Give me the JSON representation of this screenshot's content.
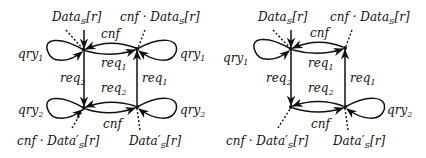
{
  "diagrams": [
    {
      "name": "left-automaton",
      "nodes": {
        "tl": {
          "x": 84,
          "y": 50
        },
        "tr": {
          "x": 137,
          "y": 49
        },
        "bl": {
          "x": 84,
          "y": 108
        },
        "br": {
          "x": 137,
          "y": 107
        }
      },
      "labels": {
        "top_left": "Data",
        "top_left_sub": "S",
        "top_left_tail": "[r]",
        "top_right_prefix": "cnf · Data",
        "top_right_sub": "S",
        "top_right_tail": "[r]",
        "bottom_left_prefix": "cnf · Data′",
        "bottom_left_sub": "S",
        "bottom_left_tail": "[r]",
        "bottom_right": "Data′",
        "bottom_right_sub": "S",
        "bottom_right_tail": "[r]",
        "cnf_top": "cnf",
        "req1_top": "req",
        "req1_top_sub": "1",
        "req2_left": "req",
        "req2_left_sub": "2",
        "req1_right": "req",
        "req1_right_sub": "1",
        "req2_bottom": "req",
        "req2_bottom_sub": "2",
        "cnf_bottom": "cnf",
        "qry1_left": "qry",
        "qry1_left_sub": "1",
        "qry1_right": "qry",
        "qry1_right_sub": "1",
        "qry2_left": "qry",
        "qry2_left_sub": "2",
        "qry2_right": "qry",
        "qry2_right_sub": "2"
      }
    },
    {
      "name": "right-automaton",
      "nodes": {
        "tl": {
          "x": 291,
          "y": 49
        },
        "tr": {
          "x": 345,
          "y": 48
        },
        "bl": {
          "x": 291,
          "y": 107
        },
        "br": {
          "x": 345,
          "y": 107
        }
      },
      "labels": {
        "top_left": "Data",
        "top_left_sub": "S",
        "top_left_tail": "[r]",
        "top_right_prefix": "cnf · Data",
        "top_right_sub": "S",
        "top_right_tail": "[r]",
        "bottom_left_prefix": "cnf · Data′",
        "bottom_left_sub": "S",
        "bottom_left_tail": "[r]",
        "bottom_right": "Data′",
        "bottom_right_sub": "S",
        "bottom_right_tail": "[r]",
        "cnf_top": "cnf",
        "req1_top": "req",
        "req1_top_sub": "1",
        "req2_left": "req",
        "req2_left_sub": "2",
        "req1_right": "req",
        "req1_right_sub": "1",
        "req2_bottom": "req",
        "req2_bottom_sub": "2",
        "cnf_bottom": "cnf",
        "qry1_left": "qry",
        "qry1_left_sub": "1",
        "qry2_right": "qry",
        "qry2_right_sub": "2"
      }
    }
  ]
}
